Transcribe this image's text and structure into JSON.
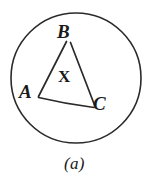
{
  "figure": {
    "caption": "(a)",
    "background_color": "#ffffff",
    "ink_color": "#1a1a1a",
    "width": 164,
    "height": 186
  },
  "circle": {
    "name": "circumscribed-circle",
    "center_x": 76,
    "center_y": 78,
    "radius": 65,
    "stroke_color": "#2a2a2a",
    "stroke_width": 1.6
  },
  "triangle": {
    "name": "inscribed-triangle-ABC",
    "stroke_color": "#2a2a2a",
    "stroke_width": 1.6,
    "vertices": [
      {
        "label": "B",
        "x": 68,
        "y": 41
      },
      {
        "label": "C",
        "x": 95,
        "y": 106
      },
      {
        "label": "A",
        "x": 38,
        "y": 97
      }
    ],
    "edges": [
      {
        "name": "edge-AB",
        "from": "A",
        "to": "B"
      },
      {
        "name": "edge-BC",
        "from": "B",
        "to": "C"
      },
      {
        "name": "edge-AC",
        "from": "A",
        "to": "C"
      }
    ]
  },
  "labels": {
    "vertex_a": "A",
    "vertex_b": "B",
    "vertex_c": "C",
    "interior_region": "X"
  }
}
